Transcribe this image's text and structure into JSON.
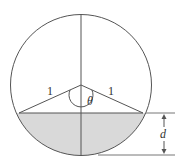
{
  "diagram": {
    "labels": {
      "radius_left": "1",
      "radius_right": "1",
      "angle": "θ",
      "depth": "d"
    },
    "colors": {
      "stroke": "#555555",
      "shade": "#d9d9d9",
      "background": "#ffffff"
    }
  }
}
